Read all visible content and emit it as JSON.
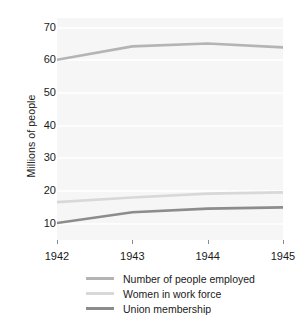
{
  "chart_data": {
    "type": "line",
    "title": "",
    "xlabel": "",
    "ylabel": "Millions of people",
    "x": [
      "1942",
      "1943",
      "1944",
      "1945"
    ],
    "xtick_labels": [
      "1942",
      "1943",
      "1944",
      "1945"
    ],
    "ytick_labels": [
      "10",
      "20",
      "30",
      "40",
      "50",
      "60",
      "70"
    ],
    "ytick_values": [
      10,
      20,
      30,
      40,
      50,
      60,
      70
    ],
    "ylim": [
      5,
      73
    ],
    "xlim": [
      "1942",
      "1945"
    ],
    "grid": "horizontal",
    "legend_position": "bottom",
    "series": [
      {
        "name": "Number of people employed",
        "color": "#b4b4b4",
        "values": [
          60.2,
          64.3,
          65.2,
          64.0
        ]
      },
      {
        "name": "Women in work force",
        "color": "#d8d8d8",
        "values": [
          16.6,
          18.0,
          19.2,
          19.6
        ]
      },
      {
        "name": "Union membership",
        "color": "#8c8c8c",
        "values": [
          10.2,
          13.5,
          14.6,
          15.0
        ]
      }
    ]
  },
  "figure": {
    "background_color": "#ffffff",
    "plot_background_color": "#f6f6f6",
    "gridline_color": "#fdfdfd",
    "text_color": "#1a1a1a",
    "tick_color": "#8a8a8a"
  }
}
